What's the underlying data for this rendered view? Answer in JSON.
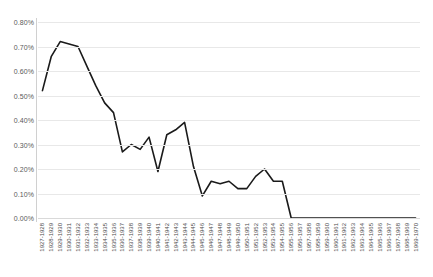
{
  "chart_data": {
    "type": "line",
    "title": "",
    "subtitle": "",
    "xlabel": "",
    "ylabel": "",
    "ylim": [
      0.0,
      0.8
    ],
    "ytick_values": [
      0.0,
      0.1,
      0.2,
      0.3,
      0.4,
      0.5,
      0.6,
      0.7,
      0.8
    ],
    "ytick_labels": [
      "0.00%",
      "0.10%",
      "0.20%",
      "0.30%",
      "0.40%",
      "0.50%",
      "0.60%",
      "0.70%",
      "0.80%"
    ],
    "grid": true,
    "grid_axis": "y",
    "legend": false,
    "legend_position": "none",
    "value_unit": "percent",
    "series_color": "#1a1a1a",
    "categories": [
      "1927-1928",
      "1928-1929",
      "1929-1930",
      "1930-1931",
      "1931-1932",
      "1932-1933",
      "1933-1934",
      "1934-1935",
      "1935-1936",
      "1936-1937",
      "1937-1938",
      "1938-1939",
      "1939-1940",
      "1940-1941",
      "1941-1942",
      "1942-1943",
      "1943-1944",
      "1944-1945",
      "1945-1946",
      "1946-1947",
      "1947-1948",
      "1948-1949",
      "1949-1950",
      "1950-1951",
      "1951-1952",
      "1952-1953",
      "1953-1954",
      "1954-1955",
      "1955-1956",
      "1956-1957",
      "1957-1958",
      "1958-1959",
      "1959-1960",
      "1960-1961",
      "1961-1962",
      "1962-1963",
      "1963-1964",
      "1964-1965",
      "1965-1966",
      "1966-1967",
      "1967-1968",
      "1968-1969",
      "1969-1970"
    ],
    "series": [
      {
        "name": "Share",
        "values": [
          0.52,
          0.66,
          0.72,
          0.71,
          0.7,
          0.62,
          0.54,
          0.47,
          0.43,
          0.27,
          0.3,
          0.28,
          0.33,
          0.19,
          0.34,
          0.36,
          0.39,
          0.21,
          0.09,
          0.15,
          0.14,
          0.15,
          0.12,
          0.12,
          0.17,
          0.2,
          0.15,
          0.15,
          0.0,
          0.0,
          0.0,
          0.0,
          0.0,
          0.0,
          0.0,
          0.0,
          0.0,
          0.0,
          0.0,
          0.0,
          0.0,
          0.0,
          0.0
        ]
      }
    ]
  }
}
